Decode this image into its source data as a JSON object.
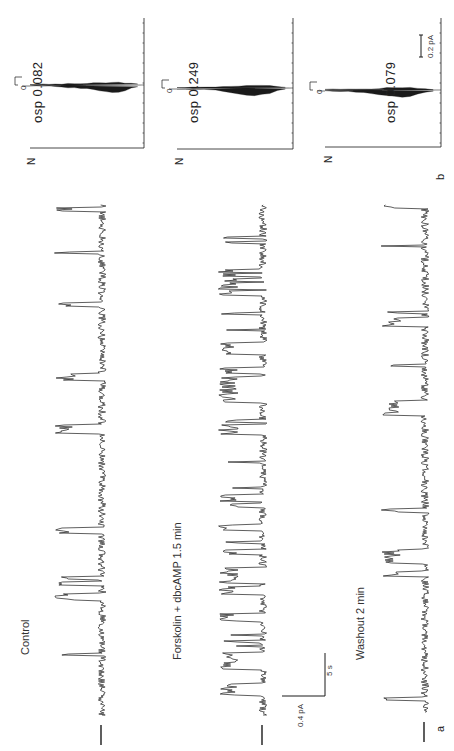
{
  "figure": {
    "panel_a_label": "a",
    "panel_b_label": "b",
    "orientation": "rotated 90 degrees counter-clockwise",
    "ink_color": "#1a1a1a",
    "background": "#ffffff"
  },
  "traces": [
    {
      "condition": "Control",
      "osp_label": "osp 0.082",
      "osp_value": 0.082
    },
    {
      "condition": "Forskolin + dbcAMP 1.5 min",
      "osp_label": "osp 0.249",
      "osp_value": 0.249
    },
    {
      "condition": "Washout 2 min",
      "osp_label": "osp 0.079",
      "osp_value": 0.079
    }
  ],
  "scale_bars": {
    "trace_current": "0.4 pA",
    "trace_time": "5 s",
    "histogram_current": "0.2 pA"
  },
  "histograms": [
    {
      "axis_label": "N",
      "zero_label": "0",
      "scale_tick": "1"
    },
    {
      "axis_label": "N",
      "zero_label": "0",
      "scale_tick": "1"
    },
    {
      "axis_label": "N",
      "zero_label": "0",
      "scale_tick": "1"
    }
  ],
  "chart_data": [
    {
      "type": "line",
      "title": "Single-channel current traces (panel a)",
      "xlabel": "time (scale bar 5 s)",
      "ylabel": "current (scale bar 0.4 pA)",
      "series": [
        {
          "name": "Control",
          "open_probability": 0.082
        },
        {
          "name": "Forskolin + dbcAMP 1.5 min",
          "open_probability": 0.249
        },
        {
          "name": "Washout 2 min",
          "open_probability": 0.079
        }
      ],
      "annotations": [
        "osp 0.082",
        "osp 0.249",
        "osp 0.079"
      ],
      "grid": false
    },
    {
      "type": "bar",
      "title": "Amplitude histograms (panel b)",
      "xlabel": "current (scale bar 0.2 pA)",
      "ylabel": "N",
      "series": [
        {
          "name": "Control",
          "profile": [
            2,
            3,
            5,
            8,
            14,
            22,
            30,
            36,
            40,
            44,
            58,
            72,
            85,
            95,
            100,
            80,
            40,
            12
          ]
        },
        {
          "name": "Forskolin + dbcAMP 1.5 min",
          "profile": [
            1,
            2,
            4,
            8,
            14,
            26,
            45,
            62,
            78,
            92,
            100,
            90,
            70,
            30,
            10
          ]
        },
        {
          "name": "Washout 2 min",
          "profile": [
            1,
            3,
            6,
            10,
            18,
            28,
            40,
            55,
            70,
            86,
            100,
            88,
            50,
            20,
            6
          ]
        }
      ],
      "grid": false
    }
  ]
}
